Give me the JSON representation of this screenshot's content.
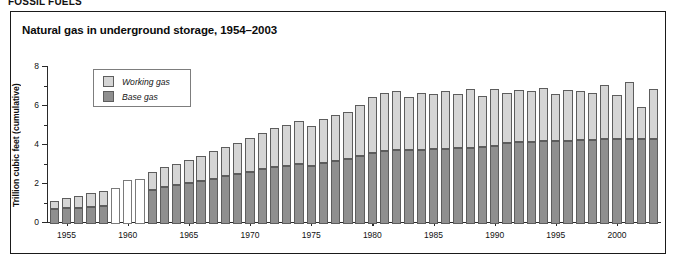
{
  "cut_header_text": "FOSSIL FUELS",
  "chart_title": "Natural gas in underground storage, 1954–2003",
  "legend": {
    "items": [
      {
        "label": "Working gas",
        "color": "#d5d5d5",
        "name": "working-gas"
      },
      {
        "label": "Base gas",
        "color": "#8f8f8f",
        "name": "base-gas"
      }
    ]
  },
  "chart_data": {
    "type": "bar",
    "stacked": true,
    "title": "Natural gas in underground storage, 1954–2003",
    "xlabel": "",
    "ylabel": "Trillion cubic feet (cumulative)",
    "ylim": [
      0,
      8
    ],
    "yticks": [
      0,
      2,
      4,
      6,
      8
    ],
    "yticks_minor": [
      1,
      3,
      5,
      7
    ],
    "ytick_labels": [
      "0",
      "2",
      "4",
      "6",
      "8"
    ],
    "xlim": [
      1953.4,
      2003.6
    ],
    "xticks": [
      1955,
      1960,
      1965,
      1970,
      1975,
      1980,
      1985,
      1990,
      1995,
      2000
    ],
    "xtick_labels": [
      "1955",
      "1960",
      "1965",
      "1970",
      "1975",
      "1980",
      "1985",
      "1990",
      "1995",
      "2000"
    ],
    "grid": false,
    "legend_position": "upper-left-inset",
    "categories": [
      1954,
      1955,
      1956,
      1957,
      1958,
      1959,
      1960,
      1961,
      1962,
      1963,
      1964,
      1965,
      1966,
      1967,
      1968,
      1969,
      1970,
      1971,
      1972,
      1973,
      1974,
      1975,
      1976,
      1977,
      1978,
      1979,
      1980,
      1981,
      1982,
      1983,
      1984,
      1985,
      1986,
      1987,
      1988,
      1989,
      1990,
      1991,
      1992,
      1993,
      1994,
      1995,
      1996,
      1997,
      1998,
      1999,
      2000,
      2001,
      2002,
      2003
    ],
    "series": [
      {
        "name": "Base gas",
        "color": "#8f8f8f",
        "values": [
          0.78,
          0.8,
          0.83,
          0.87,
          0.92,
          null,
          null,
          null,
          1.75,
          1.9,
          2.0,
          2.1,
          2.2,
          2.3,
          2.45,
          2.55,
          2.65,
          2.8,
          2.9,
          3.0,
          3.1,
          2.95,
          3.15,
          3.25,
          3.35,
          3.5,
          3.65,
          3.75,
          3.8,
          3.8,
          3.82,
          3.84,
          3.85,
          3.88,
          3.92,
          3.95,
          4.0,
          4.15,
          4.2,
          4.22,
          4.24,
          4.26,
          4.28,
          4.3,
          4.32,
          4.34,
          4.34,
          4.34,
          4.34,
          4.35
        ]
      },
      {
        "name": "Working gas",
        "color": "#d5d5d5",
        "values": [
          0.42,
          0.55,
          0.62,
          0.73,
          0.78,
          null,
          null,
          null,
          0.9,
          1.0,
          1.1,
          1.2,
          1.3,
          1.45,
          1.5,
          1.6,
          1.75,
          1.85,
          2.0,
          2.1,
          2.2,
          2.1,
          2.25,
          2.35,
          2.4,
          2.6,
          2.85,
          2.95,
          3.0,
          2.7,
          2.88,
          2.85,
          2.95,
          2.8,
          2.98,
          2.62,
          2.9,
          2.55,
          2.65,
          2.58,
          2.75,
          2.4,
          2.6,
          2.5,
          2.4,
          2.8,
          2.3,
          2.95,
          1.65,
          2.55
        ]
      }
    ],
    "totals": [
      1.2,
      1.35,
      1.45,
      1.6,
      1.7,
      1.85,
      2.25,
      2.3,
      2.65,
      2.9,
      3.1,
      3.3,
      3.5,
      3.75,
      3.95,
      4.15,
      4.4,
      4.65,
      4.9,
      5.1,
      5.3,
      5.05,
      5.4,
      5.6,
      5.75,
      6.1,
      6.5,
      6.7,
      6.8,
      6.5,
      6.7,
      6.69,
      6.8,
      6.68,
      6.9,
      6.57,
      6.9,
      6.7,
      6.85,
      6.8,
      6.99,
      6.66,
      6.88,
      6.8,
      6.72,
      7.14,
      6.64,
      7.29,
      5.99,
      6.9
    ],
    "no_data_years": [
      1959,
      1960,
      1961
    ],
    "no_data_totals": [
      1.85,
      2.25,
      2.3
    ]
  }
}
